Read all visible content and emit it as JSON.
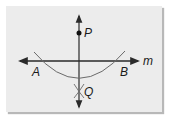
{
  "diagram": {
    "labels": {
      "P": "P",
      "Q": "Q",
      "A": "A",
      "B": "B",
      "m": "m"
    },
    "colors": {
      "background": "#ececec",
      "line": "#3a3a3a",
      "arc": "#6a6a6a"
    }
  }
}
